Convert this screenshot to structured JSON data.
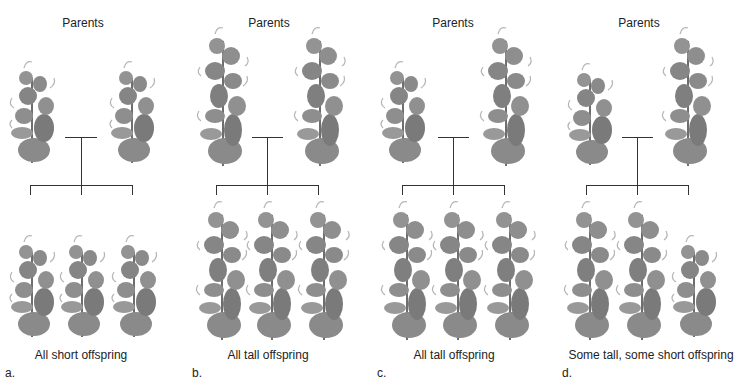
{
  "colors": {
    "plant_fill": "#8a8a8a",
    "plant_dark": "#6e6e6e",
    "plant_light": "#b5b5b5",
    "line": "#333333",
    "text": "#222222"
  },
  "panels": [
    {
      "letter": "a.",
      "parents_label": "Parents",
      "parents": [
        "short",
        "short"
      ],
      "offspring": [
        "short",
        "short",
        "short"
      ],
      "caption": "All short offspring"
    },
    {
      "letter": "b.",
      "parents_label": "Parents",
      "parents": [
        "tall",
        "tall"
      ],
      "offspring": [
        "tall",
        "tall",
        "tall"
      ],
      "caption": "All tall offspring"
    },
    {
      "letter": "c.",
      "parents_label": "Parents",
      "parents": [
        "short",
        "tall"
      ],
      "offspring": [
        "tall",
        "tall",
        "tall"
      ],
      "caption": "All tall offspring"
    },
    {
      "letter": "d.",
      "parents_label": "Parents",
      "parents": [
        "short",
        "tall"
      ],
      "offspring": [
        "tall",
        "tall",
        "short"
      ],
      "caption": "Some tall, some short offspring"
    }
  ]
}
